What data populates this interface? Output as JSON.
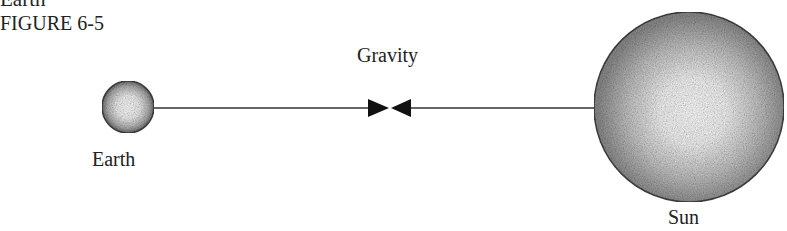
{
  "figure": {
    "cut_off_text": "Earth",
    "label": "FIGURE 6-5"
  },
  "diagram": {
    "force_label": "Gravity",
    "bodies": [
      {
        "name": "Earth",
        "label": "Earth",
        "center": [
          128,
          107
        ],
        "radius": 26
      },
      {
        "name": "Sun",
        "label": "Sun",
        "center": [
          689,
          107
        ],
        "radius": 95
      }
    ],
    "arrows": [
      {
        "from": "Earth",
        "direction": "toward Sun"
      },
      {
        "from": "Sun",
        "direction": "toward Earth"
      }
    ],
    "colors": {
      "line": "#333333",
      "arrowhead": "#111111",
      "body_edge": "#444444",
      "body_fill_center": "#ffffff",
      "body_fill_edge": "#8a8a8a"
    }
  }
}
